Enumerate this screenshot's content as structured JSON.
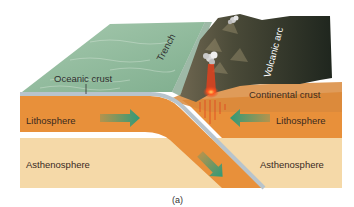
{
  "figure": {
    "caption": "(a)"
  },
  "labels": {
    "oceanic_crust": "Oceanic crust",
    "trench": "Trench",
    "volcanic_arc": "Volcanic arc",
    "continental_crust": "Continental crust",
    "lithosphere_left": "Lithosphere",
    "lithosphere_right": "Lithosphere",
    "asthenosphere_left": "Asthenosphere",
    "asthenosphere_right": "Asthenosphere"
  },
  "arrows": [
    {
      "name": "oceanic-plate-motion-arrow",
      "direction": "right"
    },
    {
      "name": "continental-plate-motion-arrow",
      "direction": "left"
    },
    {
      "name": "subduction-arrow",
      "direction": "down-right"
    }
  ],
  "colors": {
    "ocean_surface": "#8fb89a",
    "lithosphere": "#e8903a",
    "asthenosphere": "#f5d9a8",
    "oceanic_crust_band": "#b8c4cc",
    "mountains": "#2a3026",
    "magma": "#e8401c",
    "arrow": "#3a9a7a"
  }
}
